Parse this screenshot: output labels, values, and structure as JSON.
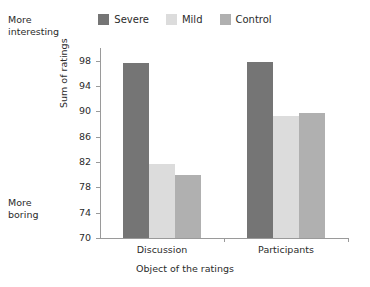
{
  "chart_data": {
    "type": "bar",
    "title": "",
    "categories": [
      "Discussion",
      "Participants"
    ],
    "series": [
      {
        "name": "Severe",
        "values": [
          97.6,
          97.8
        ],
        "color": "#757575"
      },
      {
        "name": "Mild",
        "values": [
          81.7,
          89.2
        ],
        "color": "#dcdcdc"
      },
      {
        "name": "Control",
        "values": [
          79.9,
          89.7
        ],
        "color": "#b0b0b0"
      }
    ],
    "xlabel": "Object of the ratings",
    "ylabel": "Sum of ratings",
    "ylim": [
      70,
      100
    ],
    "yticks": [
      70,
      74,
      78,
      82,
      86,
      90,
      94,
      98
    ],
    "grid": false,
    "legend_position": "top-center",
    "annotations": [
      {
        "name": "more-interesting",
        "lines": [
          "More",
          "interesting"
        ],
        "position": "left-top"
      },
      {
        "name": "more-boring",
        "lines": [
          "More",
          "boring"
        ],
        "position": "left-bottom"
      }
    ]
  },
  "legend": {
    "items": [
      {
        "label": "Severe",
        "color": "#757575"
      },
      {
        "label": "Mild",
        "color": "#dcdcdc"
      },
      {
        "label": "Control",
        "color": "#b0b0b0"
      }
    ]
  },
  "axes": {
    "y_title": "Sum of ratings",
    "x_title": "Object of the ratings",
    "y_tick_labels": [
      "98",
      "94",
      "90",
      "86",
      "82",
      "78",
      "74",
      "70"
    ],
    "x_tick_labels": [
      "Discussion",
      "Participants"
    ]
  },
  "notes": {
    "top": {
      "line1": "More",
      "line2": "interesting"
    },
    "bottom": {
      "line1": "More",
      "line2": "boring"
    }
  }
}
